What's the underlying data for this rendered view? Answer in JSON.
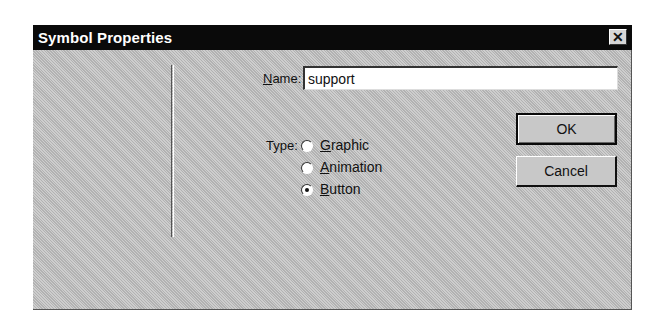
{
  "dialog": {
    "title": "Symbol Properties",
    "close_glyph": "✕"
  },
  "form": {
    "name_label_mnemonic": "N",
    "name_label_rest": "ame:",
    "name_value": "support",
    "type_label": "Type:",
    "type_options": [
      {
        "mnemonic": "G",
        "rest": "raphic",
        "label": "Graphic",
        "checked": false
      },
      {
        "mnemonic": "A",
        "rest": "nimation",
        "label": "Animation",
        "checked": false
      },
      {
        "mnemonic": "B",
        "rest": "utton",
        "label": "Button",
        "checked": true
      }
    ]
  },
  "buttons": {
    "ok_label": "OK",
    "cancel_label": "Cancel"
  }
}
